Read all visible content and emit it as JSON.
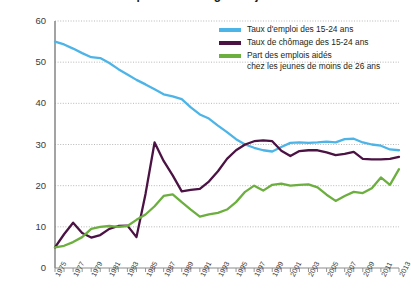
{
  "chart_data": {
    "type": "line",
    "title": "Emploi et chômage des jeunes",
    "xlabel": "",
    "ylabel": "",
    "xlim": [
      1975,
      2013
    ],
    "ylim": [
      0,
      60
    ],
    "y_ticks": [
      0,
      10,
      20,
      30,
      40,
      50,
      60
    ],
    "grid": true,
    "legend_position": "top-right",
    "x": [
      1975,
      1976,
      1977,
      1978,
      1979,
      1980,
      1981,
      1982,
      1983,
      1984,
      1985,
      1986,
      1987,
      1988,
      1989,
      1990,
      1991,
      1992,
      1993,
      1994,
      1995,
      1996,
      1997,
      1998,
      1999,
      2000,
      2001,
      2002,
      2003,
      2004,
      2005,
      2006,
      2007,
      2008,
      2009,
      2010,
      2011,
      2012,
      2013
    ],
    "x_tick_labels": [
      "1975",
      "1977",
      "1979",
      "1981",
      "1983",
      "1985",
      "1987",
      "1989",
      "1991",
      "1993",
      "1995",
      "1997",
      "1999",
      "2001",
      "2003",
      "2005",
      "2007",
      "2009",
      "2011",
      "2013"
    ],
    "series": [
      {
        "name": "Taux d'emploi des 15-24 ans",
        "color": "#4DB4E8",
        "values": [
          55.0,
          54.3,
          53.3,
          52.2,
          51.2,
          51.0,
          49.8,
          48.3,
          47.0,
          45.7,
          44.6,
          43.4,
          42.2,
          41.7,
          41.0,
          39.0,
          37.3,
          36.3,
          34.6,
          33.0,
          31.3,
          30.0,
          29.2,
          28.6,
          28.3,
          29.4,
          30.4,
          30.5,
          30.4,
          30.5,
          30.7,
          30.5,
          31.3,
          31.4,
          30.5,
          30.0,
          29.7,
          28.8,
          28.6
        ]
      },
      {
        "name": "Taux de chômage des 15-24 ans",
        "color": "#4B1244",
        "values": [
          5.0,
          8.2,
          11.0,
          8.5,
          7.4,
          8.0,
          9.5,
          10.2,
          10.3,
          7.5,
          18.0,
          30.5,
          26.0,
          22.5,
          18.6,
          19.0,
          19.2,
          21.0,
          23.5,
          26.5,
          28.6,
          30.0,
          30.8,
          31.0,
          30.8,
          28.5,
          27.2,
          28.4,
          28.6,
          28.6,
          28.1,
          27.4,
          27.7,
          28.2,
          26.5,
          26.4,
          26.4,
          26.5,
          27.0
        ]
      },
      {
        "name": "Part des emplois aidés chez les jeunes de moins de 26 ans",
        "color": "#6CAF3F",
        "values": [
          5.0,
          5.4,
          6.3,
          7.5,
          9.5,
          10.0,
          10.2,
          10.0,
          10.2,
          11.7,
          13.0,
          15.0,
          17.5,
          17.9,
          16.0,
          14.2,
          12.5,
          13.0,
          13.4,
          14.2,
          16.0,
          18.5,
          20.0,
          18.8,
          20.2,
          20.5,
          20.0,
          20.2,
          20.3,
          19.6,
          17.8,
          16.3,
          17.5,
          18.5,
          18.2,
          19.4,
          22.0,
          20.2,
          24.0
        ]
      }
    ],
    "legend": [
      {
        "line1": "Taux d'emploi des 15-24 ans",
        "line2": "",
        "color": "#4DB4E8"
      },
      {
        "line1": "Taux de chômage des 15-24 ans",
        "line2": "",
        "color": "#4B1244"
      },
      {
        "line1": "Part des emplois aidés",
        "line2": "chez les jeunes de moins de 26 ans",
        "color": "#6CAF3F"
      }
    ]
  }
}
